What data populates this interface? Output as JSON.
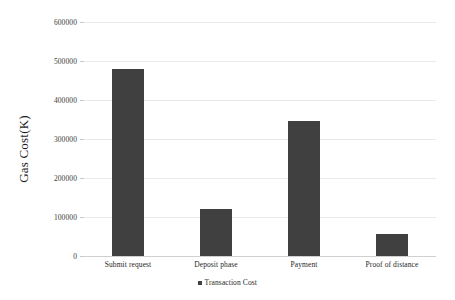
{
  "chart_data": {
    "type": "bar",
    "title": "",
    "subtitle": "",
    "xlabel": "",
    "ylabel": "Gas Cost(K)",
    "categories": [
      "Submit request",
      "Deposit phase",
      "Payment",
      "Proof of distance"
    ],
    "series": [
      {
        "name": "Transaction Cost",
        "color": "#404040",
        "values": [
          480000,
          120000,
          346000,
          56000
        ]
      }
    ],
    "ylim": [
      0,
      600000
    ],
    "yticks": [
      0,
      100000,
      200000,
      300000,
      400000,
      500000,
      600000
    ],
    "ytick_labels": [
      "0",
      "100000",
      "200000",
      "300000",
      "400000",
      "500000",
      "600000"
    ],
    "grid": true,
    "grid_axis": "y",
    "legend": {
      "position": "bottom",
      "entries": [
        {
          "label": "Transaction Cost",
          "color": "#404040",
          "marker": "square"
        }
      ]
    },
    "colors": {
      "bar": "#404040",
      "gridline": "#e9e9e9",
      "axis": "#d0d0d0",
      "text": "#262626",
      "background": "#ffffff"
    }
  }
}
